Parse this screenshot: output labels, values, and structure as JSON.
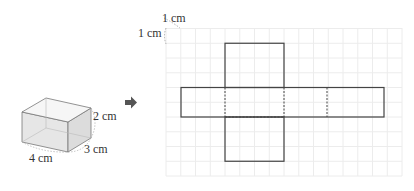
{
  "box": {
    "labels": {
      "height": "2 cm",
      "depth": "3 cm",
      "width": "4 cm"
    }
  },
  "arrow": {
    "icon": "right-arrow-icon"
  },
  "net": {
    "scale_labels": {
      "horizontal": "1 cm",
      "vertical": "1 cm"
    },
    "grid": {
      "cell_px": 14.75,
      "origin_x": 166,
      "origin_y": 28,
      "cols": 15,
      "rows": 10
    },
    "colors": {
      "grid": "#ececec",
      "outline": "#444444",
      "box_fill": "#e8e8e8"
    }
  }
}
